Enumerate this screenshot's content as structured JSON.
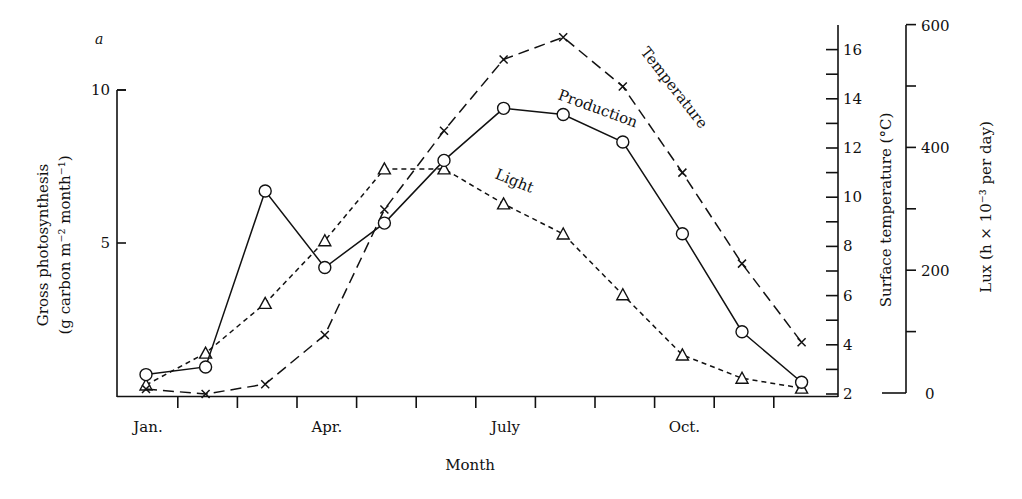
{
  "panel_label": "a",
  "axes": {
    "left": {
      "title_line1": "Gross photosynthesis",
      "title_line2": "(g carbon m⁻² month⁻¹)",
      "ticks": [
        {
          "value": 5,
          "label": "5"
        },
        {
          "value": 10,
          "label": "10"
        }
      ],
      "range": [
        0,
        10
      ]
    },
    "temperature": {
      "title": "Surface temperature (°C)",
      "labeled_ticks": [
        2,
        4,
        6,
        8,
        10,
        12,
        14,
        16
      ],
      "minor_ticks": [
        3,
        5,
        7,
        9,
        11,
        13,
        15
      ],
      "range": [
        2,
        17
      ]
    },
    "lux": {
      "title": "Lux (h × 10⁻³ per day)",
      "labeled_ticks": [
        0,
        200,
        400,
        600
      ],
      "minor_ticks": [
        100,
        300,
        500
      ],
      "range": [
        0,
        600
      ]
    },
    "x": {
      "title": "Month",
      "tick_labels": [
        {
          "index": 0,
          "label": "Jan."
        },
        {
          "index": 3,
          "label": "Apr."
        },
        {
          "index": 6,
          "label": "July"
        },
        {
          "index": 9,
          "label": "Oct."
        }
      ]
    }
  },
  "series_labels": {
    "production": "Production",
    "light": "Light",
    "temperature": "Temperature"
  },
  "chart_data": {
    "type": "line",
    "title": "",
    "xlabel": "Month",
    "ylabel": "Gross photosynthesis (g carbon m-2 month-1)",
    "ylim": [
      0,
      10
    ],
    "categories": [
      "Jan",
      "Feb",
      "Mar",
      "Apr",
      "May",
      "Jun",
      "Jul",
      "Aug",
      "Sep",
      "Oct",
      "Nov",
      "Dec"
    ],
    "series": [
      {
        "name": "Production",
        "axis": "left",
        "unit": "g carbon m-2 month-1",
        "marker": "open-circle",
        "line": "solid",
        "values": [
          0.7,
          0.95,
          6.7,
          4.2,
          5.65,
          7.7,
          9.4,
          9.2,
          8.3,
          5.3,
          2.1,
          0.45
        ]
      },
      {
        "name": "Light",
        "axis": "lux",
        "unit": "lux (h x 10^-3 per day)",
        "marker": "open-triangle",
        "line": "short-dash",
        "values": [
          13,
          65,
          146,
          248,
          365,
          365,
          308,
          259,
          160,
          62,
          24,
          8
        ]
      },
      {
        "name": "Temperature",
        "axis": "temperature",
        "unit": "°C",
        "marker": "cross",
        "line": "long-dash",
        "values": [
          2.2,
          2.0,
          2.4,
          4.4,
          9.5,
          12.7,
          15.6,
          16.5,
          14.5,
          11.0,
          7.3,
          4.1
        ]
      }
    ],
    "secondary_axes": [
      {
        "name": "Surface temperature (°C)",
        "range": [
          2,
          17
        ],
        "ticks": [
          2,
          4,
          6,
          8,
          10,
          12,
          14,
          16
        ]
      },
      {
        "name": "Lux (h × 10^-3 per day)",
        "range": [
          0,
          600
        ],
        "ticks": [
          0,
          200,
          400,
          600
        ]
      }
    ],
    "grid": false,
    "legend": "inline labels on lines"
  }
}
